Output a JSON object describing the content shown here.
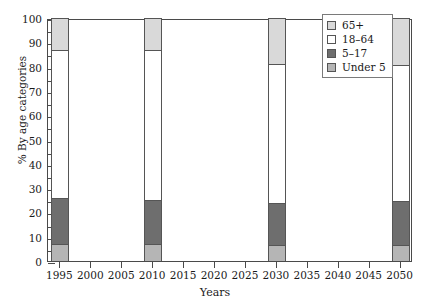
{
  "chart_data": {
    "type": "bar",
    "title": "",
    "subtitle": "",
    "xlabel": "Years",
    "ylabel": "% By age categories",
    "categories": [
      "1995",
      "2010",
      "2030",
      "2050"
    ],
    "series": [
      {
        "name": "Under 5",
        "values": [
          7,
          7,
          6.5,
          6.5
        ],
        "color": "#b5b5b5"
      },
      {
        "name": "5–17",
        "values": [
          19,
          18,
          17.5,
          18
        ],
        "color": "#6e6e6e"
      },
      {
        "name": "18–64",
        "values": [
          61,
          62,
          57,
          56
        ],
        "color": "#ffffff"
      },
      {
        "name": "65+",
        "values": [
          13,
          13,
          19,
          19.5
        ],
        "color": "#d9d9d9"
      }
    ],
    "stacked": true,
    "ylim": [
      0,
      100
    ],
    "ytick_values": [
      0,
      10,
      20,
      30,
      40,
      50,
      60,
      70,
      80,
      90,
      100
    ],
    "ytick_labels": [
      "0",
      "10",
      "20",
      "30",
      "40",
      "50",
      "60",
      "70",
      "80",
      "90",
      "100"
    ],
    "yminor_values": [
      5,
      15,
      25,
      35,
      45,
      55,
      65,
      75,
      85,
      95
    ],
    "xlim": [
      1993,
      2052
    ],
    "xtick_values": [
      1995,
      2000,
      2005,
      2010,
      2015,
      2020,
      2025,
      2030,
      2035,
      2040,
      2045,
      2050
    ],
    "xtick_labels": [
      "1995",
      "2000",
      "2005",
      "2010",
      "2015",
      "2020",
      "2025",
      "2030",
      "2035",
      "2040",
      "2045",
      "2050"
    ],
    "grid": false,
    "legend_position": "top-right",
    "legend_entries": [
      {
        "label": "65+",
        "color": "#d9d9d9"
      },
      {
        "label": "18–64",
        "color": "#ffffff"
      },
      {
        "label": "5–17",
        "color": "#6e6e6e"
      },
      {
        "label": "Under 5",
        "color": "#b5b5b5"
      }
    ],
    "bar_segment_boundaries": {
      "1995": [
        0,
        7,
        26,
        87,
        100
      ],
      "2010": [
        0,
        7,
        25,
        87,
        100
      ],
      "2030": [
        0,
        6.5,
        24,
        81,
        100
      ],
      "2050": [
        0,
        6.5,
        24.5,
        80.5,
        100
      ]
    },
    "axis_color": "#4a4a4a",
    "background_color": "#ffffff"
  }
}
